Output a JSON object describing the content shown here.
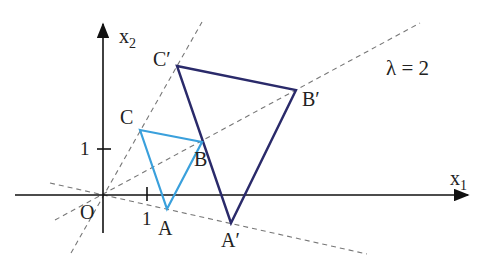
{
  "diagram": {
    "type": "homothety",
    "annotation": "λ = 2",
    "axes": {
      "x_label": "x",
      "x_sub": "1",
      "y_label": "x",
      "y_sub": "2",
      "origin_label": "O",
      "x_tick_label": "1",
      "y_tick_label": "1"
    },
    "original_triangle": {
      "color": "#3aa0dc",
      "vertices": [
        {
          "label": "A"
        },
        {
          "label": "B"
        },
        {
          "label": "C"
        }
      ]
    },
    "image_triangle": {
      "color": "#2a2a6a",
      "vertices": [
        {
          "label": "A′"
        },
        {
          "label": "B′"
        },
        {
          "label": "C′"
        }
      ]
    },
    "dashed_color": "#777777"
  }
}
